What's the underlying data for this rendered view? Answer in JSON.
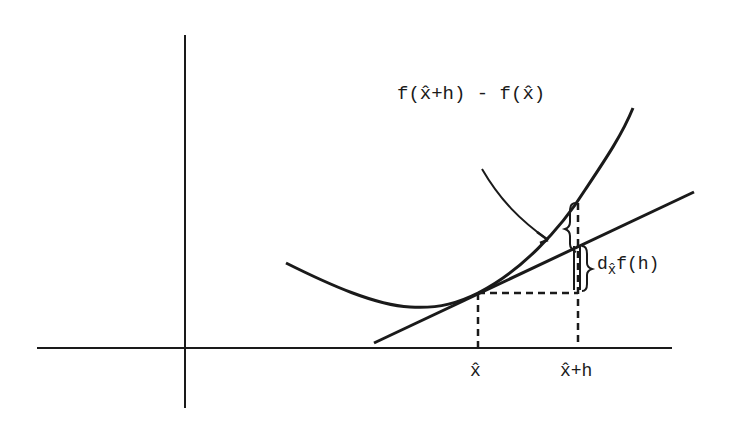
{
  "diagram": {
    "type": "differential-illustration",
    "labels": {
      "difference": "f(x̂+h) - f(x̂)",
      "differential_prefix": "d",
      "differential_sub": "x̂",
      "differential_suffix": "f(h)",
      "x_hat": "x̂",
      "x_hat_plus_h": "x̂+h"
    },
    "colors": {
      "ink": "#1a1a1a",
      "background": "#ffffff"
    },
    "elements": [
      "vertical axis",
      "horizontal axis",
      "convex curve f",
      "tangent line at x̂",
      "dashed vertical at x̂",
      "dashed vertical at x̂+h",
      "dashed horizontal from tangent point",
      "arrow pointing to f(x̂+h) - f(x̂) gap",
      "brace for f(x̂+h) - f(x̂)",
      "brace for d_x̂ f(h)"
    ]
  }
}
